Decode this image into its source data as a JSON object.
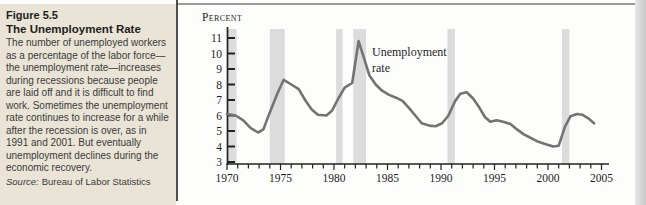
{
  "panel": {
    "figure_label": "Figure 5.5",
    "title": "The Unemployment Rate",
    "body": "The number of unemployed workers as a percentage of the labor force—the unemployment rate—increases during recessions because people are laid off and it is difficult to find work. Sometimes the unemployment rate continues to increase for a while after the recession is over, as in 1991 and 2001. But eventually unemployment declines during the economic recovery.",
    "source_label": "Source:",
    "source_text": "Bureau of Labor Statistics"
  },
  "chart_data": {
    "type": "line",
    "title": "",
    "xlabel": "",
    "ylabel": "Percent",
    "annotation": "Unemployment rate",
    "annotation_lines": [
      "Unemployment",
      "rate"
    ],
    "xlim": [
      1970,
      2006
    ],
    "ylim": [
      3,
      11.6
    ],
    "x_ticks": [
      1970,
      1975,
      1980,
      1985,
      1990,
      1995,
      2000,
      2005
    ],
    "y_ticks": [
      3,
      4,
      5,
      6,
      7,
      8,
      9,
      10,
      11
    ],
    "grid": false,
    "legend_position": "none",
    "line_color": "#737373",
    "band_color": "#dcdcdc",
    "recession_bands": [
      [
        1970.0,
        1970.9
      ],
      [
        1974.0,
        1975.4
      ],
      [
        1980.2,
        1980.8
      ],
      [
        1981.8,
        1983.0
      ],
      [
        1990.6,
        1991.3
      ],
      [
        2001.3,
        2002.0
      ]
    ],
    "series": [
      {
        "name": "Unemployment rate",
        "points": [
          [
            1970.0,
            6.1
          ],
          [
            1970.8,
            6.0
          ],
          [
            1971.5,
            5.7
          ],
          [
            1972.2,
            5.2
          ],
          [
            1972.9,
            4.9
          ],
          [
            1973.4,
            5.1
          ],
          [
            1974.0,
            6.2
          ],
          [
            1974.7,
            7.4
          ],
          [
            1975.3,
            8.3
          ],
          [
            1976.0,
            8.0
          ],
          [
            1976.7,
            7.7
          ],
          [
            1977.3,
            7.0
          ],
          [
            1977.9,
            6.4
          ],
          [
            1978.5,
            6.05
          ],
          [
            1979.3,
            6.0
          ],
          [
            1979.8,
            6.3
          ],
          [
            1980.4,
            7.1
          ],
          [
            1981.0,
            7.8
          ],
          [
            1981.7,
            8.1
          ],
          [
            1982.3,
            10.8
          ],
          [
            1982.8,
            9.7
          ],
          [
            1983.3,
            8.6
          ],
          [
            1983.9,
            8.0
          ],
          [
            1984.5,
            7.6
          ],
          [
            1985.1,
            7.35
          ],
          [
            1985.8,
            7.15
          ],
          [
            1986.4,
            6.95
          ],
          [
            1987.0,
            6.5
          ],
          [
            1987.6,
            6.0
          ],
          [
            1988.2,
            5.5
          ],
          [
            1988.9,
            5.35
          ],
          [
            1989.5,
            5.3
          ],
          [
            1990.1,
            5.5
          ],
          [
            1990.7,
            6.0
          ],
          [
            1991.3,
            6.9
          ],
          [
            1991.8,
            7.4
          ],
          [
            1992.4,
            7.5
          ],
          [
            1993.0,
            7.1
          ],
          [
            1993.6,
            6.5
          ],
          [
            1994.1,
            5.9
          ],
          [
            1994.6,
            5.6
          ],
          [
            1995.2,
            5.7
          ],
          [
            1995.8,
            5.6
          ],
          [
            1996.5,
            5.45
          ],
          [
            1997.1,
            5.1
          ],
          [
            1997.7,
            4.8
          ],
          [
            1998.4,
            4.55
          ],
          [
            1999.1,
            4.3
          ],
          [
            1999.8,
            4.15
          ],
          [
            2000.5,
            4.0
          ],
          [
            2001.0,
            4.05
          ],
          [
            2001.6,
            5.3
          ],
          [
            2002.1,
            5.95
          ],
          [
            2002.7,
            6.1
          ],
          [
            2003.2,
            6.05
          ],
          [
            2003.8,
            5.8
          ],
          [
            2004.3,
            5.5
          ]
        ]
      }
    ]
  }
}
